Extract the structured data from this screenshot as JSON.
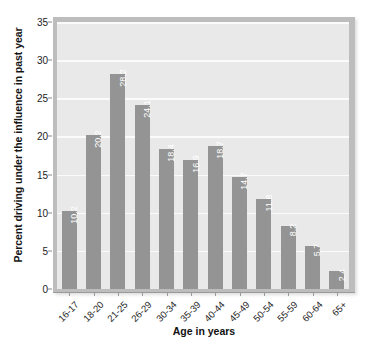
{
  "chart_data": {
    "type": "bar",
    "title": "",
    "xlabel": "Age in years",
    "ylabel": "Percent driving under the influence in past year",
    "categories": [
      "16-17",
      "18-20",
      "21-25",
      "26-29",
      "30-34",
      "35-39",
      "40-44",
      "45-49",
      "50-54",
      "55-59",
      "60-64",
      "65+"
    ],
    "values": [
      10.2,
      20.2,
      28.2,
      24.1,
      18.4,
      16.9,
      18.7,
      14.7,
      11.8,
      8.2,
      5.7,
      2.4
    ],
    "value_labels": [
      "10.2",
      "20.2",
      "28.2",
      "24.1",
      "18.4",
      "16.9",
      "18.7",
      "14.7",
      "11.8",
      "8.2",
      "5.7",
      "2.4"
    ],
    "ylim": [
      0,
      35
    ],
    "yticks": [
      0,
      5,
      10,
      15,
      20,
      25,
      30,
      35
    ],
    "ytick_labels": [
      "0",
      "5",
      "10",
      "15",
      "20",
      "25",
      "30",
      "35"
    ],
    "grid": "horizontal",
    "legend": "none",
    "colors": {
      "bar": "#949494",
      "bar_label_text": "#ffffff",
      "plot_background": "#e9e9e9",
      "gridline": "#fbfbfb",
      "frame": "#bdbdbd",
      "axis_text": "#1c1c1c",
      "figure_background": "#ffffff"
    }
  }
}
